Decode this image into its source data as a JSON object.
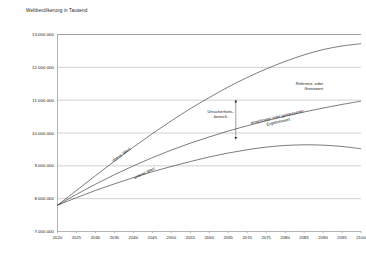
{
  "chart_data": {
    "type": "line",
    "title": "Weltbevölkerung in Tausend",
    "xlabel": "",
    "ylabel": "",
    "xlim": [
      2020,
      2100
    ],
    "ylim": [
      7000000,
      13000000
    ],
    "grid": true,
    "legend_position": "inline-annotations",
    "x_ticks": [
      "2020",
      "2025",
      "2030",
      "2035",
      "2040",
      "2045",
      "2050",
      "2055",
      "2060",
      "2065",
      "2070",
      "2075",
      "2080",
      "2085",
      "2090",
      "2095",
      "2100"
    ],
    "y_ticks": [
      "7.000.000",
      "8.000.000",
      "9.000.000",
      "10.000.000",
      "11.000.000",
      "12.000.000",
      "13.000.000"
    ],
    "x": [
      2020,
      2025,
      2030,
      2035,
      2040,
      2045,
      2050,
      2055,
      2060,
      2065,
      2070,
      2075,
      2080,
      2085,
      2090,
      2095,
      2100
    ],
    "series": [
      {
        "name": "oberer Wert",
        "values": [
          7800000,
          8250000,
          8700000,
          9140000,
          9570000,
          9980000,
          10370000,
          10740000,
          11080000,
          11400000,
          11690000,
          11950000,
          12180000,
          12380000,
          12540000,
          12650000,
          12720000
        ]
      },
      {
        "name": "errechneter oder gemessener Ergebniswert",
        "values": [
          7800000,
          8130000,
          8440000,
          8730000,
          9000000,
          9250000,
          9480000,
          9690000,
          9880000,
          10060000,
          10220000,
          10370000,
          10510000,
          10640000,
          10760000,
          10870000,
          10970000
        ]
      },
      {
        "name": "unterer Wert",
        "values": [
          7800000,
          8030000,
          8250000,
          8450000,
          8640000,
          8820000,
          8980000,
          9130000,
          9270000,
          9390000,
          9490000,
          9570000,
          9620000,
          9640000,
          9630000,
          9590000,
          9520000
        ]
      }
    ],
    "annotations": [
      {
        "id": "upper-curve-label",
        "text": "oberer Wert",
        "x": 2037,
        "y": 9300000,
        "rotation": -36
      },
      {
        "id": "lower-curve-label",
        "text": "unterer Wert",
        "x": 2043,
        "y": 8740000,
        "rotation": -25
      },
      {
        "id": "reference-limit-label",
        "text_line1": "Referenz- oder",
        "text_line2": "Grenzwert",
        "x": 2090,
        "y": 11450000
      },
      {
        "id": "uncertainty-range-label",
        "text_line1": "Unsicherheits-",
        "text_line2": "bereich",
        "x": 2063,
        "y": 10600000
      },
      {
        "id": "result-value-label",
        "text_line1": "errechneter oder gemessener",
        "text_line2": "Ergebniswert",
        "x": 2078,
        "y": 10450000,
        "rotation": -13
      },
      {
        "id": "uncertainty-arrow",
        "type": "double-arrow",
        "x": 2067,
        "y_top": 11010000,
        "y_bottom": 9800000
      }
    ]
  }
}
